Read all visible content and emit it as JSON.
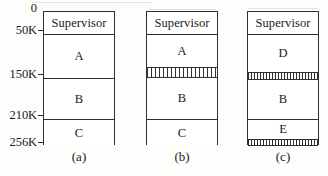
{
  "figure": {
    "type": "memory-allocation-diagram",
    "background_color": "#fdfdfc",
    "line_color": "#2f2f2f"
  },
  "axis": {
    "name": "memory-address-scale",
    "unit": "K",
    "ticks": [
      {
        "label": "0",
        "address_k": 0,
        "top_px": 0
      },
      {
        "label": "50K",
        "address_k": 50,
        "top_px": 22
      },
      {
        "label": "150K",
        "address_k": 150,
        "top_px": 66
      },
      {
        "label": "210K",
        "address_k": 210,
        "top_px": 107
      },
      {
        "label": "256K",
        "address_k": 256,
        "top_px": 134
      }
    ]
  },
  "diagrams": [
    {
      "id": "a",
      "caption": "(a)",
      "segments": [
        {
          "label": "Supervisor",
          "kind": "block",
          "top_px": 0,
          "height_px": 22
        },
        {
          "label": "A",
          "kind": "block",
          "top_px": 22,
          "height_px": 44
        },
        {
          "label": "B",
          "kind": "block",
          "top_px": 66,
          "height_px": 41
        },
        {
          "label": "C",
          "kind": "block",
          "top_px": 107,
          "height_px": 27
        }
      ]
    },
    {
      "id": "b",
      "caption": "(b)",
      "segments": [
        {
          "label": "Supervisor",
          "kind": "block",
          "top_px": 0,
          "height_px": 22
        },
        {
          "label": "A",
          "kind": "block",
          "top_px": 22,
          "height_px": 33
        },
        {
          "label": "",
          "kind": "hatch",
          "top_px": 55,
          "height_px": 11,
          "hatch_style": "coarse"
        },
        {
          "label": "B",
          "kind": "block",
          "top_px": 66,
          "height_px": 41
        },
        {
          "label": "C",
          "kind": "block",
          "top_px": 107,
          "height_px": 27
        }
      ]
    },
    {
      "id": "c",
      "caption": "(c)",
      "segments": [
        {
          "label": "Supervisor",
          "kind": "block",
          "top_px": 0,
          "height_px": 22
        },
        {
          "label": "D",
          "kind": "block",
          "top_px": 22,
          "height_px": 38
        },
        {
          "label": "",
          "kind": "hatch",
          "top_px": 60,
          "height_px": 8,
          "hatch_style": "fine"
        },
        {
          "label": "B",
          "kind": "block",
          "top_px": 68,
          "height_px": 39
        },
        {
          "label": "E",
          "kind": "block",
          "top_px": 107,
          "height_px": 20
        },
        {
          "label": "",
          "kind": "hatch",
          "top_px": 127,
          "height_px": 7,
          "hatch_style": "fine"
        }
      ]
    }
  ],
  "smudges": [
    {
      "left_px": 32,
      "top_px": 2,
      "width_px": 120
    },
    {
      "left_px": 148,
      "top_px": 9,
      "width_px": 68
    },
    {
      "left_px": 248,
      "top_px": 8,
      "width_px": 70
    }
  ]
}
